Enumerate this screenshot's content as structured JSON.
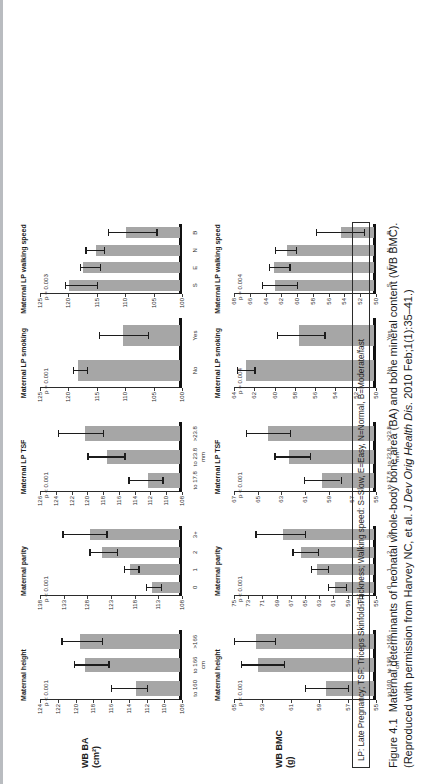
{
  "figure": {
    "number": "Figure 4.1",
    "caption_part1": "Maternal determinants of neonatal whole-body bone area (BA) and bone mineral content (WB BMC). (Reproduced with permission from Harvey NC, et al. ",
    "journal": "J Dev Orig Health Dis.",
    "caption_part2": " 2010 Feb;1(1):35–41.)",
    "legend": "LP: Late Pregnancy; TSF: Triceps Skinfold Thickness; Walking speed: S=Slow, E=Easy, N=Normal, B=Moderate/fast"
  },
  "rows": [
    {
      "id": "wb-ba",
      "ylabel_line1": "WB BA",
      "ylabel_line2": "(cm²)"
    },
    {
      "id": "wb-bmc",
      "ylabel_line1": "WB BMC",
      "ylabel_line2": "(g)"
    }
  ],
  "chart_data": [
    {
      "type": "bar",
      "panel": "wb-ba-maternal-height",
      "title": "Maternal height",
      "annotation": "p < 0.001",
      "xlabel": "cm",
      "ylabel": "WB BA (cm²)",
      "categories": [
        "to 160",
        "to 166",
        ">166"
      ],
      "values": [
        113.0,
        118.7,
        119.3
      ],
      "err_low": [
        112.0,
        116.3,
        117.0
      ],
      "err_high": [
        116.0,
        120.2,
        121.6
      ],
      "ylim": [
        108,
        124
      ],
      "yticks": [
        124,
        122,
        120,
        118,
        116,
        114,
        112,
        110,
        108
      ],
      "grid": false
    },
    {
      "type": "bar",
      "panel": "wb-ba-maternal-parity",
      "title": "Maternal parity",
      "annotation": "p < 0.001",
      "xlabel": "",
      "ylabel": "WB BA (cm²)",
      "categories": [
        "0",
        "1",
        "2",
        "3+"
      ],
      "values": [
        114.0,
        118.5,
        124.5,
        127.0
      ],
      "err_low": [
        112.5,
        117.2,
        121.8,
        124.0
      ],
      "err_high": [
        115.6,
        120.3,
        127.6,
        133.3
      ],
      "ylim": [
        108,
        138
      ],
      "yticks": [
        138,
        133,
        128,
        123,
        118,
        113,
        108
      ],
      "grid": false
    },
    {
      "type": "bar",
      "panel": "wb-ba-maternal-lp-tsf",
      "title": "Maternal LP TSF",
      "annotation": "p < 0.001",
      "xlabel": "mm",
      "ylabel": "WB BA (cm²)",
      "categories": [
        "to 17.8",
        "to 23.8",
        ">23.8"
      ],
      "values": [
        112.0,
        117.2,
        120.0
      ],
      "err_low": [
        110.5,
        115.3,
        118.0
      ],
      "err_high": [
        114.8,
        120.0,
        123.7
      ],
      "ylim": [
        108,
        126
      ],
      "yticks": [
        126,
        124,
        122,
        120,
        118,
        116,
        114,
        112,
        110,
        108
      ],
      "grid": false
    },
    {
      "type": "bar",
      "panel": "wb-ba-maternal-lp-smoking",
      "title": "Maternal LP smoking",
      "annotation": "p = 0.001",
      "xlabel": "",
      "ylabel": "WB BA (cm²)",
      "categories": [
        "No",
        "Yes"
      ],
      "values": [
        118.0,
        110.0
      ],
      "err_low": [
        116.8,
        106.0
      ],
      "err_high": [
        119.2,
        114.7
      ],
      "ylim": [
        100,
        125
      ],
      "yticks": [
        125,
        120,
        115,
        110,
        105,
        100
      ],
      "grid": false
    },
    {
      "type": "bar",
      "panel": "wb-ba-maternal-lp-walking-speed",
      "title": "Maternal LP walking speed",
      "annotation": "p = 0.003",
      "xlabel": "",
      "ylabel": "WB BA (cm²)",
      "categories": [
        "S",
        "E",
        "N",
        "B"
      ],
      "values": [
        119.5,
        117.0,
        114.8,
        109.5
      ],
      "err_low": [
        115.0,
        114.5,
        113.8,
        104.5
      ],
      "err_high": [
        120.6,
        118.0,
        117.0,
        113.0
      ],
      "ylim": [
        100,
        125
      ],
      "yticks": [
        125,
        120,
        115,
        110,
        105,
        100
      ],
      "grid": false
    },
    {
      "type": "bar",
      "panel": "wb-bmc-maternal-height",
      "title": "Maternal height",
      "annotation": "p < 0.001",
      "xlabel": "cm",
      "ylabel": "WB BMC (g)",
      "categories": [
        "to 160",
        "to 166",
        ">166"
      ],
      "values": [
        58.4,
        63.2,
        63.3
      ],
      "err_low": [
        57.0,
        61.5,
        62.1
      ],
      "err_high": [
        60.0,
        64.5,
        65.0
      ],
      "ylim": [
        55,
        65
      ],
      "yticks": [
        65,
        63,
        61,
        59,
        57,
        55
      ],
      "grid": false
    },
    {
      "type": "bar",
      "panel": "wb-bmc-maternal-parity",
      "title": "Maternal parity",
      "annotation": "p < 0.001",
      "xlabel": "",
      "ylabel": "WB BMC (g)",
      "categories": [
        "0",
        "1",
        "2",
        "3+"
      ],
      "values": [
        60.5,
        63.0,
        65.3,
        67.8
      ],
      "err_low": [
        59.2,
        61.8,
        63.2,
        65.0
      ],
      "err_high": [
        61.8,
        64.2,
        66.8,
        72.0
      ],
      "ylim": [
        55,
        75
      ],
      "yticks": [
        75,
        73,
        71,
        69,
        67,
        65,
        63,
        61,
        59,
        57,
        55
      ],
      "grid": false
    },
    {
      "type": "bar",
      "panel": "wb-bmc-maternal-lp-tsf",
      "title": "Maternal LP TSF",
      "annotation": "p < 0.001",
      "xlabel": "mm",
      "ylabel": "WB BMC (g)",
      "categories": [
        "to 17.8",
        "to 23.8",
        ">23.8"
      ],
      "values": [
        59.4,
        62.2,
        64.0
      ],
      "err_low": [
        58.0,
        60.6,
        62.3
      ],
      "err_high": [
        61.1,
        63.6,
        66.0
      ],
      "ylim": [
        55,
        67
      ],
      "yticks": [
        67,
        65,
        63,
        61,
        59,
        57,
        55
      ],
      "grid": false
    },
    {
      "type": "bar",
      "panel": "wb-bmc-maternal-lp-smoking",
      "title": "Maternal LP smoking",
      "annotation": "p = 0.004",
      "xlabel": "",
      "ylabel": "WB BMC (g)",
      "categories": [
        "No",
        "Yes"
      ],
      "values": [
        62.6,
        57.4
      ],
      "err_low": [
        62.0,
        55.1
      ],
      "err_high": [
        63.7,
        59.8
      ],
      "ylim": [
        50,
        64
      ],
      "yticks": [
        64,
        62,
        60,
        58,
        56,
        54,
        52,
        50
      ],
      "grid": false
    },
    {
      "type": "bar",
      "panel": "wb-bmc-maternal-lp-walking-speed",
      "title": "Maternal LP walking speed",
      "annotation": "p = 0.004",
      "xlabel": "",
      "ylabel": "WB BMC (g)",
      "categories": [
        "S",
        "E",
        "N",
        "B"
      ],
      "values": [
        62.6,
        62.7,
        61.0,
        54.2
      ],
      "err_low": [
        60.0,
        61.0,
        60.2,
        51.5
      ],
      "err_high": [
        64.5,
        63.6,
        62.8,
        57.6
      ],
      "ylim": [
        50,
        68
      ],
      "yticks": [
        68,
        66,
        64,
        62,
        60,
        58,
        56,
        54,
        52,
        50
      ],
      "grid": false
    }
  ]
}
